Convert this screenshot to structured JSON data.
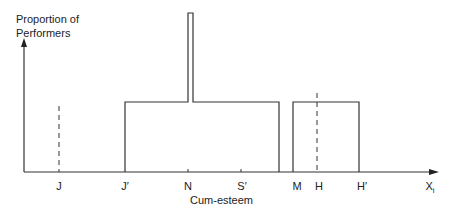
{
  "diagram": {
    "y_axis_label_line1": "Proportion of",
    "y_axis_label_line2": "Performers",
    "x_axis_title": "Cum-esteem",
    "x_axis_end_label": "X",
    "x_axis_end_subscript": "i",
    "ticks": [
      {
        "label": "J",
        "x": 59
      },
      {
        "label": "J′",
        "x": 125
      },
      {
        "label": "N",
        "x": 188
      },
      {
        "label": "S′",
        "x": 241
      },
      {
        "label": "M",
        "x": 297
      },
      {
        "label": "H",
        "x": 319
      },
      {
        "label": "H′",
        "x": 362
      }
    ],
    "shapes": [
      {
        "name": "main-block",
        "from": "J′",
        "to": "just before M",
        "height": "medium"
      },
      {
        "name": "spike",
        "at": "N",
        "height": "tall"
      },
      {
        "name": "right-block",
        "from": "M",
        "to": "H′",
        "height": "medium"
      },
      {
        "name": "dashed-line",
        "at": "J"
      },
      {
        "name": "dashed-line",
        "at": "H"
      }
    ],
    "line_color": "#333333"
  }
}
